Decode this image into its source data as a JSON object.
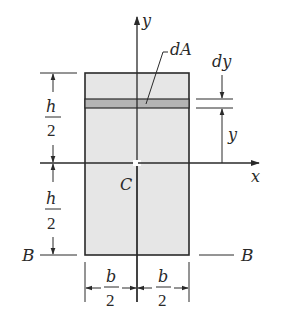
{
  "figure": {
    "colors": {
      "background": "#ffffff",
      "section_fill": "#e6e6e6",
      "strip_fill": "#b4b4b4",
      "line": "#2a2a2a"
    },
    "axes": {
      "x_label": "x",
      "y_label": "y"
    },
    "centroid_label": "C",
    "strip_label": "dA",
    "strip_thickness_label": "dy",
    "strip_distance_label": "y",
    "height_dims": [
      {
        "numerator": "h",
        "denominator": "2"
      },
      {
        "numerator": "h",
        "denominator": "2"
      }
    ],
    "width_dims": [
      {
        "numerator": "b",
        "denominator": "2"
      },
      {
        "numerator": "b",
        "denominator": "2"
      }
    ],
    "base_axis": {
      "left_label": "B",
      "right_label": "B"
    }
  }
}
